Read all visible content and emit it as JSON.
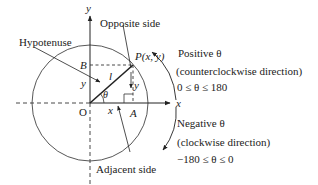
{
  "diagram": {
    "axes": {
      "x_label": "x",
      "y_label": "y",
      "origin_label": "O"
    },
    "points": {
      "P": "P(x, y)",
      "A": "A",
      "B": "B"
    },
    "segment_labels": {
      "hyp": "l",
      "opp": "y",
      "adj": "x",
      "left_y": "y",
      "theta": "θ"
    },
    "callouts": {
      "hypotenuse": "Hypotenuse",
      "opposite": "Opposite side",
      "adjacent": "Adjacent side"
    },
    "positive": {
      "title": "Positive θ",
      "direction": "(counterclockwise direction)",
      "range": "0 ≤ θ ≤ 180"
    },
    "negative": {
      "title": "Negative θ",
      "direction": "(clockwise direction)",
      "range": "−180 ≤ θ ≤ 0"
    },
    "colors": {
      "stroke": "#222222",
      "background": "#ffffff"
    }
  }
}
